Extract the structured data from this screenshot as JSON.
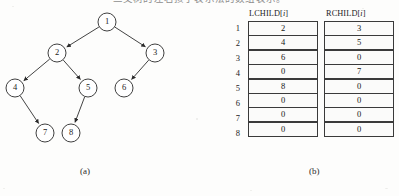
{
  "figure": {
    "top_caption_sliver": "二叉树的左右孩子表示法的数组表示。",
    "panel_a_label": "(a)",
    "panel_b_label": "(b)"
  },
  "tree": {
    "nodes": [
      {
        "id": "1",
        "label": "1",
        "cx": 107,
        "cy": 22
      },
      {
        "id": "2",
        "label": "2",
        "cx": 57,
        "cy": 53
      },
      {
        "id": "3",
        "label": "3",
        "cx": 155,
        "cy": 53
      },
      {
        "id": "4",
        "label": "4",
        "cx": 15,
        "cy": 88
      },
      {
        "id": "5",
        "label": "5",
        "cx": 88,
        "cy": 88
      },
      {
        "id": "6",
        "label": "6",
        "cx": 124,
        "cy": 88
      },
      {
        "id": "7",
        "label": "7",
        "cx": 45,
        "cy": 133
      },
      {
        "id": "8",
        "label": "8",
        "cx": 71,
        "cy": 133
      }
    ],
    "radius": 9,
    "edges": [
      {
        "from": "1",
        "to": "2"
      },
      {
        "from": "1",
        "to": "3"
      },
      {
        "from": "2",
        "to": "4"
      },
      {
        "from": "2",
        "to": "5"
      },
      {
        "from": "3",
        "to": "6"
      },
      {
        "from": "4",
        "to": "7"
      },
      {
        "from": "5",
        "to": "8"
      }
    ]
  },
  "table": {
    "headers": {
      "left": "LCHILD[",
      "left_idx": "i",
      "left_close": "]",
      "right": "RCHILD[",
      "right_idx": "i",
      "right_close": "]"
    },
    "indices": [
      "1",
      "2",
      "3",
      "4",
      "5",
      "6",
      "7",
      "8"
    ],
    "lchild": [
      "2",
      "4",
      "6",
      "0",
      "8",
      "0",
      "0",
      "0"
    ],
    "rchild": [
      "3",
      "5",
      "0",
      "7",
      "0",
      "0",
      "0",
      "0"
    ]
  },
  "colors": {
    "background": "#fdfdfc",
    "ink": "#1c1c1c",
    "cell_border": "#3a3a3a",
    "cell_fill": "#fbfbfa"
  }
}
